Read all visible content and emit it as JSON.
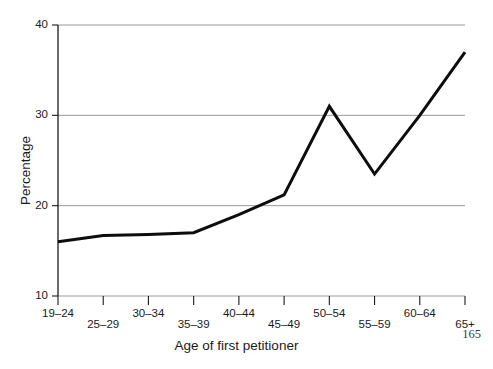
{
  "page": {
    "page_number": "165",
    "background_color": "#ffffff"
  },
  "axes": {
    "y_title": "Percentage",
    "x_title": "Age of first petitioner",
    "axis_color": "#1a1a1a",
    "grid_color": "#9a9a9a",
    "line_color": "#0d0d0d"
  },
  "chart_data": {
    "type": "line",
    "title": "",
    "xlabel": "Age of first petitioner",
    "ylabel": "Percentage",
    "categories": [
      "19–24",
      "25–29",
      "30–34",
      "35–39",
      "40–44",
      "45–49",
      "50–54",
      "55–59",
      "60–64",
      "65+"
    ],
    "values": [
      16.0,
      16.7,
      16.8,
      17.0,
      19.0,
      21.2,
      31.0,
      23.5,
      30.0,
      37.0
    ],
    "ylim": [
      10,
      40
    ],
    "yticks": [
      10,
      20,
      30,
      40
    ],
    "ytick_labels": [
      "10",
      "20",
      "30",
      "40"
    ],
    "grid": "horizontal",
    "legend": "none",
    "series": [
      {
        "name": "Percentage",
        "values": [
          16.0,
          16.7,
          16.8,
          17.0,
          19.0,
          21.2,
          31.0,
          23.5,
          30.0,
          37.0
        ],
        "color": "#0d0d0d",
        "line_width": 3
      }
    ]
  }
}
